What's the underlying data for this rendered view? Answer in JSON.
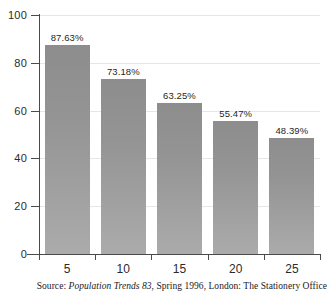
{
  "chart_data": {
    "type": "bar",
    "title": "",
    "subtitle": "",
    "xlabel": "",
    "ylabel": "",
    "categories": [
      "5",
      "10",
      "15",
      "20",
      "25"
    ],
    "values": [
      87.63,
      73.18,
      63.25,
      55.47,
      48.39
    ],
    "data_labels": [
      "87.63%",
      "73.18%",
      "63.25%",
      "55.47%",
      "48.39%"
    ],
    "ylim": [
      0,
      100
    ],
    "yticks": [
      0,
      20,
      40,
      60,
      80,
      100
    ],
    "ytick_labels": [
      "0",
      "20",
      "40",
      "60",
      "80",
      "100"
    ],
    "xtick_labels": [
      "5",
      "10",
      "15",
      "20",
      "25"
    ],
    "grid": true,
    "grid_axis": "y",
    "legend": null,
    "legend_position": "none",
    "bar_color_top": "#8d8d8d",
    "bar_color_bottom": "#ababab",
    "grid_color": "#e6e6e6",
    "axis_color": "#4a4a4a",
    "text_color": "#2b2b2b",
    "background": "#ffffff"
  },
  "source_note": {
    "prefix": "Source:",
    "title_italic": "Population Trends 83",
    "suffix": ", Spring 1996, London: The Stationery Office"
  }
}
